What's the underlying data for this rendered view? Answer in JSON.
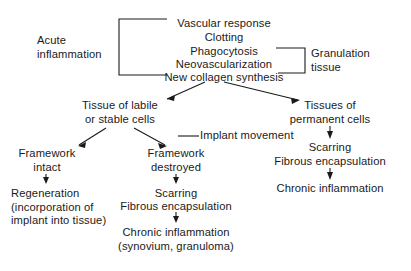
{
  "diagram": {
    "stroke_color": "#1a1a1a",
    "background_color": "#ffffff",
    "nodes": {
      "acute_inflammation": "Acute\ninflammation",
      "vascular_response": "Vascular response",
      "clotting": "Clotting",
      "phagocytosis": "Phagocytosis",
      "neovascularization": "Neovascularization",
      "new_collagen_synthesis": "New collagen synthesis",
      "granulation_tissue": "Granulation\ntissue",
      "tissue_labile_stable": "Tissue of labile\nor stable cells",
      "tissues_permanent": "Tissues of\npermanent cells",
      "implant_movement": "Implant movement",
      "framework_intact": "Framework\nintact",
      "framework_destroyed": "Framework\ndestroyed",
      "regeneration": "Regeneration\n(incorporation of\nimplant into tissue)",
      "scarring_middle": "Scarring",
      "fibrous_encapsulation_middle": "Fibrous encapsulation",
      "chronic_inflammation_middle": "Chronic inflammation\n(synovium, granuloma)",
      "scarring_right": "Scarring",
      "fibrous_encapsulation_right": "Fibrous encapsulation",
      "chronic_inflammation_right": "Chronic inflammation"
    }
  }
}
